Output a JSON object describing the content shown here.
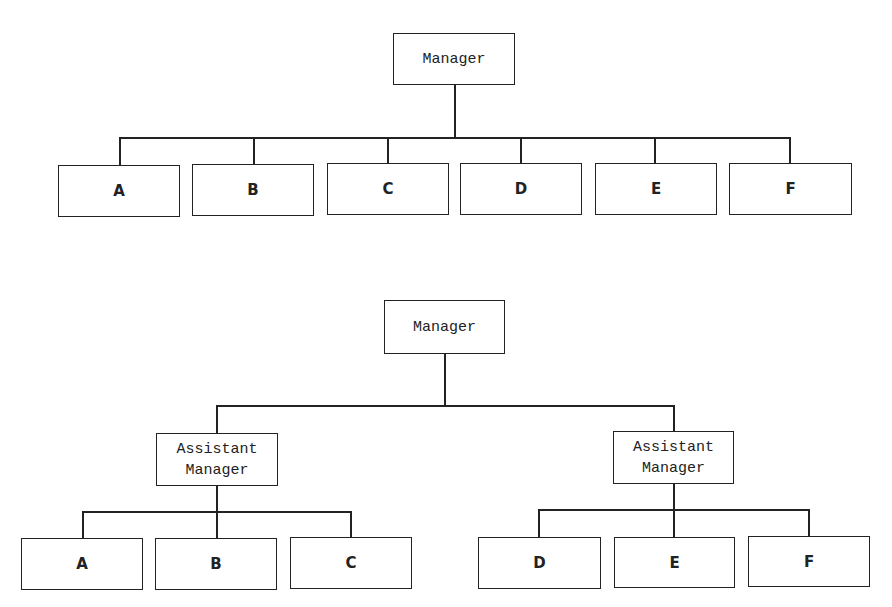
{
  "diagram_top": {
    "title": "Flat structure",
    "root": {
      "label": "Manager",
      "box": [
        393,
        33,
        122,
        52
      ]
    },
    "children": [
      {
        "label": "A",
        "box": [
          58,
          165,
          122,
          52
        ]
      },
      {
        "label": "B",
        "box": [
          192,
          164,
          122,
          52
        ]
      },
      {
        "label": "C",
        "box": [
          327,
          163,
          122,
          52
        ]
      },
      {
        "label": "D",
        "box": [
          460,
          163,
          122,
          52
        ]
      },
      {
        "label": "E",
        "box": [
          595,
          163,
          122,
          52
        ]
      },
      {
        "label": "F",
        "box": [
          729,
          163,
          123,
          52
        ]
      }
    ]
  },
  "diagram_bottom": {
    "title": "Structure with assistant managers",
    "root": {
      "label": "Manager",
      "box": [
        384,
        300,
        121,
        54
      ]
    },
    "assistants": [
      {
        "label": "Assistant\nManager",
        "box": [
          156,
          433,
          122,
          53
        ],
        "children": [
          {
            "label": "A",
            "box": [
              21,
              538,
              122,
              52
            ]
          },
          {
            "label": "B",
            "box": [
              155,
              538,
              122,
              52
            ]
          },
          {
            "label": "C",
            "box": [
              290,
              537,
              122,
              52
            ]
          }
        ]
      },
      {
        "label": "Assistant\nManager",
        "box": [
          613,
          431,
          121,
          53
        ],
        "children": [
          {
            "label": "D",
            "box": [
              478,
              537,
              123,
              52
            ]
          },
          {
            "label": "E",
            "box": [
              614,
              537,
              121,
              51
            ]
          },
          {
            "label": "F",
            "box": [
              748,
              536,
              122,
              51
            ]
          }
        ]
      }
    ]
  },
  "colors": {
    "line": "#222222",
    "background": "#ffffff"
  }
}
